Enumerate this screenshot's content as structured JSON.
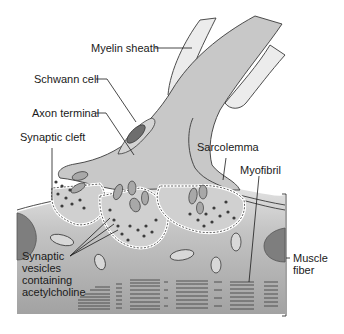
{
  "diagram": {
    "labels": {
      "myelin_sheath": "Myelin sheath",
      "schwann_cell": "Schwann cell",
      "axon_terminal": "Axon terminal",
      "synaptic_cleft": "Synaptic cleft",
      "sarcolemma": "Sarcolemma",
      "myofibril": "Myofibril",
      "synaptic_vesicles": [
        "Synaptic",
        "vesicles",
        "containing",
        "acetylcholine"
      ],
      "muscle_fiber": [
        "Muscle",
        "fiber"
      ]
    },
    "colors": {
      "axon": "#c8c8c8",
      "myelin": "#ececec",
      "schwann_nucleus": "#6e6e6e",
      "muscle_top": "#d6d6d6",
      "muscle_bottom": "#9a9a9a",
      "outline": "#3a3a3a",
      "vesicle": "#3c3c3c",
      "nucleus": "#7a7a7a"
    }
  }
}
